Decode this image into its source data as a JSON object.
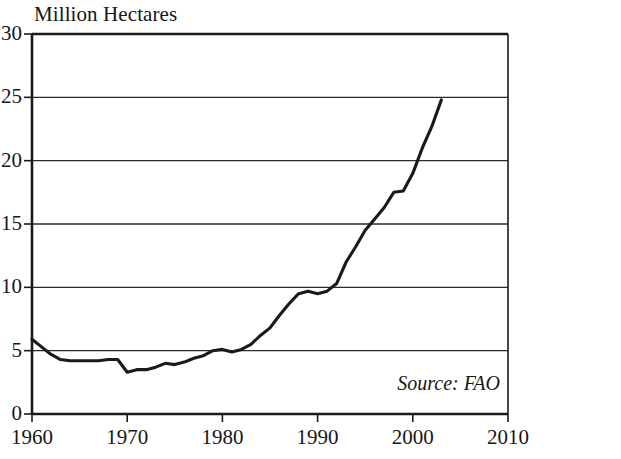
{
  "chart_data": {
    "type": "line",
    "title": "Million Hectares",
    "xlabel": "",
    "ylabel": "Million Hectares",
    "xlim": [
      1960,
      2010
    ],
    "ylim": [
      0,
      30
    ],
    "grid": true,
    "legend_position": "none",
    "x_ticks": [
      "1960",
      "1970",
      "1980",
      "1990",
      "2000",
      "2010"
    ],
    "x_tick_values": [
      1960,
      1970,
      1980,
      1990,
      2000,
      2010
    ],
    "y_ticks": [
      "0",
      "5",
      "10",
      "15",
      "20",
      "25",
      "30"
    ],
    "y_tick_values": [
      0,
      5,
      10,
      15,
      20,
      25,
      30
    ],
    "annotations": [
      {
        "text": "Source: FAO",
        "position": "bottom-right-inside-plot"
      }
    ],
    "series": [
      {
        "name": "Area",
        "color": "#1a1a1a",
        "x": [
          1960,
          1961,
          1962,
          1963,
          1964,
          1965,
          1966,
          1967,
          1968,
          1969,
          1970,
          1971,
          1972,
          1973,
          1974,
          1975,
          1976,
          1977,
          1978,
          1979,
          1980,
          1981,
          1982,
          1983,
          1984,
          1985,
          1986,
          1987,
          1988,
          1989,
          1990,
          1991,
          1992,
          1993,
          1994,
          1995,
          1996,
          1997,
          1998,
          1999,
          2000,
          2001,
          2002,
          2003
        ],
        "values": [
          5.9,
          5.3,
          4.7,
          4.3,
          4.2,
          4.2,
          4.2,
          4.2,
          4.3,
          4.3,
          3.3,
          3.5,
          3.5,
          3.7,
          4.0,
          3.9,
          4.1,
          4.4,
          4.6,
          5.0,
          5.1,
          4.9,
          5.1,
          5.5,
          6.2,
          6.8,
          7.8,
          8.7,
          9.5,
          9.7,
          9.5,
          9.7,
          10.3,
          12.0,
          13.2,
          14.5,
          15.4,
          16.3,
          17.5,
          17.6,
          19.0,
          21.0,
          22.7,
          24.8
        ]
      }
    ]
  },
  "geometry": {
    "plot_left": 32,
    "plot_right": 508,
    "plot_top": 34,
    "plot_bottom": 414
  }
}
